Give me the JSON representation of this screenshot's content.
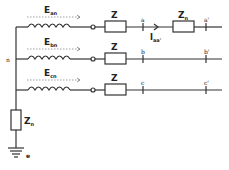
{
  "diagram": {
    "type": "three-phase circuit with neutral grounding impedance",
    "neutral_label": "n",
    "ground_label": "e",
    "neutral_impedance": {
      "label": "Z",
      "sub": "n"
    },
    "phases": [
      {
        "emf": {
          "label": "E",
          "sub": "an"
        },
        "impedance": "Z",
        "node_start": "a",
        "node_end": "a'",
        "line_impedance": {
          "label": "Z",
          "sub": "n"
        },
        "current": {
          "label": "I",
          "sub": "aa'"
        }
      },
      {
        "emf": {
          "label": "E",
          "sub": "bn"
        },
        "impedance": "Z",
        "node_start": "b",
        "node_end": "b'"
      },
      {
        "emf": {
          "label": "E",
          "sub": "cn"
        },
        "impedance": "Z",
        "node_start": "c",
        "node_end": "c'"
      }
    ]
  }
}
